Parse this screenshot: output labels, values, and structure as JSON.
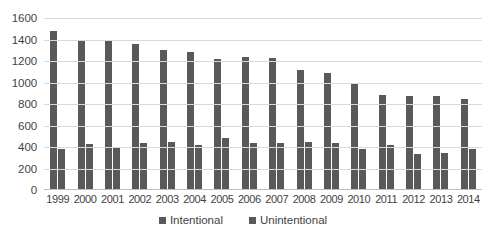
{
  "chart_data": {
    "type": "bar",
    "title": "",
    "subtitle": "",
    "xlabel": "",
    "ylabel": "",
    "ylim": [
      0,
      1600
    ],
    "ytick_step": 200,
    "yticks": [
      1600,
      1400,
      1200,
      1000,
      800,
      600,
      400,
      200,
      0
    ],
    "grid": true,
    "legend_position": "bottom",
    "categories": [
      "1999",
      "2000",
      "2001",
      "2002",
      "2003",
      "2004",
      "2005",
      "2006",
      "2007",
      "2008",
      "2009",
      "2010",
      "2011",
      "2012",
      "2013",
      "2014"
    ],
    "series": [
      {
        "name": "Intentional",
        "color": "#595959",
        "values": [
          1480,
          1390,
          1385,
          1355,
          1300,
          1280,
          1215,
          1235,
          1230,
          1120,
          1090,
          995,
          880,
          870,
          870,
          845
        ]
      },
      {
        "name": "Unintentional",
        "color": "#595959",
        "values": [
          385,
          430,
          390,
          440,
          450,
          415,
          480,
          440,
          440,
          445,
          440,
          380,
          420,
          335,
          340,
          385
        ]
      }
    ]
  },
  "legend": {
    "items": [
      {
        "label": "Intentional",
        "color": "#595959"
      },
      {
        "label": "Unintentional",
        "color": "#595959"
      }
    ]
  },
  "colors": {
    "bar": "#595959",
    "gridline": "#d9d9d9",
    "axis": "#bfbfbf",
    "text": "#3f3f3f",
    "background": "#ffffff"
  }
}
